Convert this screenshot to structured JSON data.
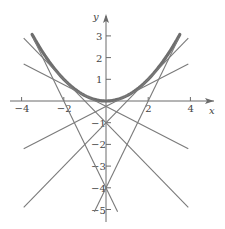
{
  "chart_data": {
    "type": "line",
    "title": "",
    "xlabel": "x",
    "ylabel": "y",
    "xlim": [
      -4.5,
      5
    ],
    "ylim": [
      -5.5,
      4
    ],
    "grid": false,
    "x_ticks": [
      -4,
      -2,
      2,
      4
    ],
    "y_ticks": [
      3,
      2,
      1,
      -1,
      -2,
      -3,
      -4,
      -5
    ],
    "series": [
      {
        "name": "parabola y = x^2/4",
        "kind": "curve",
        "x_range": [
          -3.5,
          3.5
        ],
        "style": "thick"
      },
      {
        "name": "tangent y = x/2 - 1/4",
        "slope": 0.5,
        "intercept": -0.25,
        "x_range": [
          -3.9,
          3.9
        ]
      },
      {
        "name": "tangent y = -x/2 - 1/4",
        "slope": -0.5,
        "intercept": -0.25,
        "x_range": [
          -3.9,
          3.9
        ]
      },
      {
        "name": "tangent y = x - 1",
        "slope": 1,
        "intercept": -1,
        "x_range": [
          -3.9,
          3.9
        ]
      },
      {
        "name": "tangent y = -x - 1",
        "slope": -1,
        "intercept": -1,
        "x_range": [
          -3.9,
          3.9
        ]
      },
      {
        "name": "tangent y = 2x - 4",
        "slope": 2,
        "intercept": -4,
        "x_range": [
          -0.55,
          3.45
        ]
      },
      {
        "name": "tangent y = -2x - 4",
        "slope": -2,
        "intercept": -4,
        "x_range": [
          -3.45,
          0.55
        ]
      }
    ]
  },
  "labels": {
    "x_axis": "x",
    "y_axis": "y",
    "xt": [
      "-4",
      "-2",
      "2",
      "4"
    ],
    "yt": [
      "3",
      "2",
      "1",
      "-1",
      "-2",
      "-3",
      "-4",
      "-5"
    ]
  },
  "colors": {
    "curve": "#6e6e6e",
    "lines": "#7a7a7a",
    "axes": "#6a6a6a"
  }
}
